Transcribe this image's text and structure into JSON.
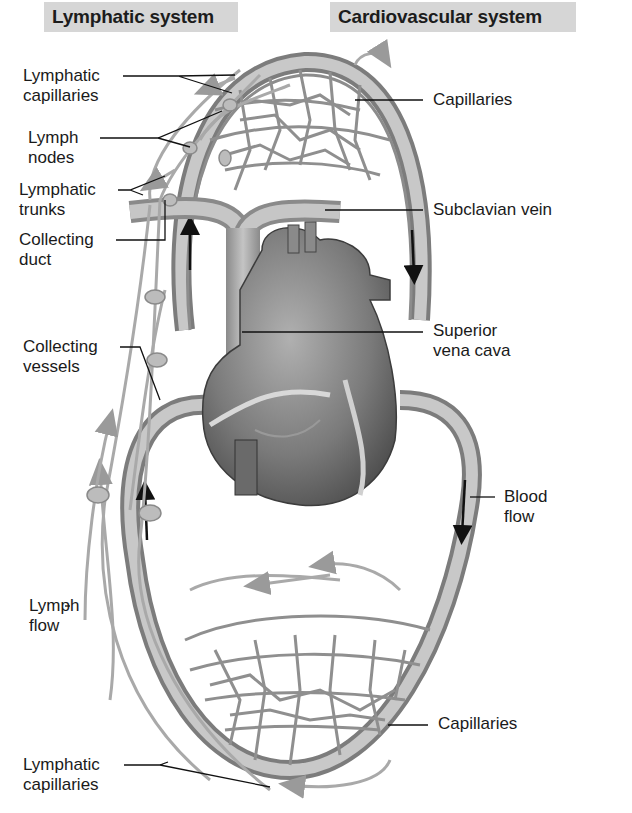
{
  "headings": {
    "lymphatic": "Lymphatic system",
    "cardiovascular": "Cardiovascular system"
  },
  "labels": {
    "left": [
      {
        "id": "lymphatic-capillaries-top",
        "line1": "Lymphatic",
        "line2": "capillaries"
      },
      {
        "id": "lymph-nodes",
        "line1": "Lymph",
        "line2": "nodes"
      },
      {
        "id": "lymphatic-trunks",
        "line1": "Lymphatic",
        "line2": "trunks"
      },
      {
        "id": "collecting-duct",
        "line1": "Collecting",
        "line2": "duct"
      },
      {
        "id": "collecting-vessels",
        "line1": "Collecting",
        "line2": "vessels"
      },
      {
        "id": "lymph-flow",
        "line1": "Lymph",
        "line2": "flow"
      },
      {
        "id": "lymphatic-capillaries-bottom",
        "line1": "Lymphatic",
        "line2": "capillaries"
      }
    ],
    "right": [
      {
        "id": "capillaries-top",
        "line1": "Capillaries"
      },
      {
        "id": "subclavian-vein",
        "line1": "Subclavian vein"
      },
      {
        "id": "superior-vena-cava",
        "line1": "Superior",
        "line2": "vena cava"
      },
      {
        "id": "blood-flow",
        "line1": "Blood",
        "line2": "flow"
      },
      {
        "id": "capillaries-bottom",
        "line1": "Capillaries"
      }
    ]
  },
  "colors": {
    "heading_bg": "#d6d6d6",
    "vessel": "#9a9a9a",
    "vessel_dark": "#6e6e6e",
    "lymph": "#a8a8a8",
    "node": "#b9b9b9",
    "heart": "#7d7d7d",
    "leader": "#111111"
  }
}
